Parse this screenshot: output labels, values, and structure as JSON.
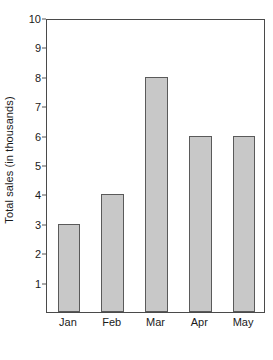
{
  "chart_data": {
    "type": "bar",
    "title": "",
    "subtitle": "",
    "categories": [
      "Jan",
      "Feb",
      "Mar",
      "Apr",
      "May"
    ],
    "values": [
      3,
      4,
      8,
      6,
      6
    ],
    "xlabel": "",
    "ylabel": "Total sales (in thousands)",
    "ylim": [
      0,
      10
    ],
    "xlim": null,
    "y_ticks": [
      1,
      2,
      3,
      4,
      5,
      6,
      7,
      8,
      9,
      10
    ],
    "y_tick_labels": [
      "1",
      "2",
      "3",
      "4",
      "5",
      "6",
      "7",
      "8",
      "9",
      "10"
    ],
    "x_tick_labels": [
      "Jan",
      "Feb",
      "Mar",
      "Apr",
      "May"
    ],
    "grid": false,
    "legend": null,
    "legend_position": "none",
    "annotations": [],
    "series": [
      {
        "name": "Total sales",
        "values": [
          3,
          4,
          8,
          6,
          6
        ]
      }
    ],
    "colors": {
      "bar_fill": "#c8c8c8",
      "bar_border": "#5a5a5a",
      "axis": "#4a4a4a",
      "text": "#1a1a1a",
      "background": "#ffffff"
    }
  }
}
